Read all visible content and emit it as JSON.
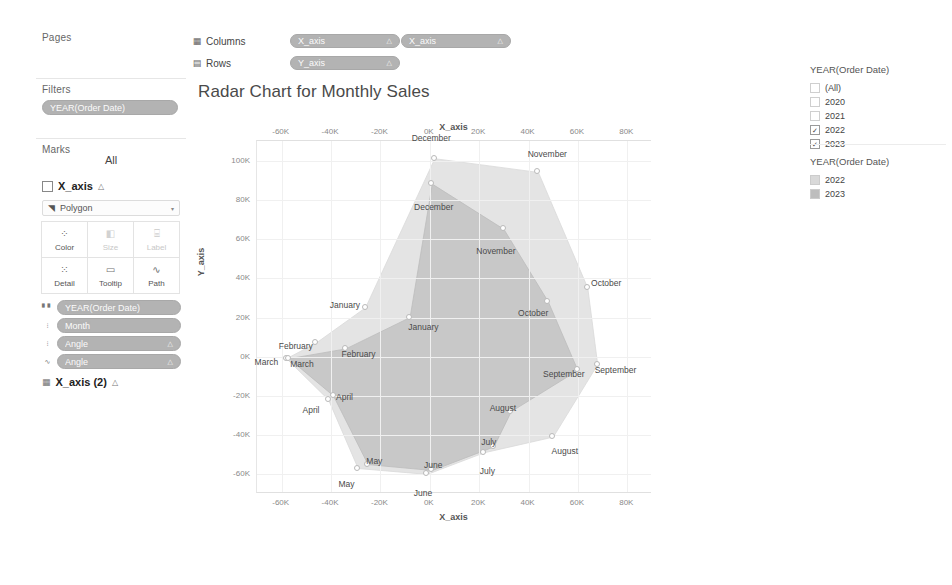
{
  "app": {
    "background": "#ffffff",
    "panel_border": "#e4e4e4"
  },
  "shelves": {
    "columns": {
      "icon": "columns-icon",
      "label": "Columns",
      "pills": [
        {
          "text": "X_axis",
          "caret": "△"
        },
        {
          "text": "X_axis",
          "caret": "△"
        }
      ]
    },
    "rows": {
      "icon": "rows-icon",
      "label": "Rows",
      "pills": [
        {
          "text": "Y_axis",
          "caret": "△"
        }
      ]
    }
  },
  "left_panel": {
    "pages": {
      "title": "Pages"
    },
    "filters": {
      "title": "Filters",
      "pills": [
        {
          "text": "YEAR(Order Date)",
          "caret": ""
        }
      ]
    },
    "marks": {
      "title": "Marks",
      "all_label": "All",
      "card_label": "X_axis",
      "card_tri": "△",
      "mark_type": "Polygon",
      "mark_type_caret": "▾",
      "buttons": [
        {
          "label": "Color",
          "icon": "color-icon",
          "glyph": "⁘",
          "dim": false
        },
        {
          "label": "Size",
          "icon": "size-icon",
          "glyph": "◧",
          "dim": true
        },
        {
          "label": "Label",
          "icon": "label-icon",
          "glyph": "⌸",
          "dim": true
        },
        {
          "label": "Detail",
          "icon": "detail-icon",
          "glyph": "⁙",
          "dim": false
        },
        {
          "label": "Tooltip",
          "icon": "tooltip-icon",
          "glyph": "▭",
          "dim": false
        },
        {
          "label": "Path",
          "icon": "path-icon",
          "glyph": "∿",
          "dim": false
        }
      ],
      "pills": [
        {
          "icon": "color-pill-icon",
          "text": "YEAR(Order Date)",
          "caret": ""
        },
        {
          "icon": "detail-pill-icon",
          "text": "Month",
          "caret": ""
        },
        {
          "icon": "detail-pill-icon2",
          "text": "Angle",
          "caret": "△"
        },
        {
          "icon": "path-pill-icon",
          "text": "Angle",
          "caret": "△"
        }
      ],
      "card2_label": "X_axis (2)",
      "card2_tri": "△",
      "card2_icon": "bar-icon"
    }
  },
  "viz": {
    "title": "Radar Chart for Monthly Sales",
    "axis_top_title": "X_axis",
    "axis_bottom_title": "X_axis",
    "axis_left_title": "Y_axis"
  },
  "right_panel": {
    "filter_card": {
      "title": "YEAR(Order Date)",
      "options": [
        {
          "label": "(All)",
          "checked": false,
          "faded": true
        },
        {
          "label": "2020",
          "checked": false,
          "faded": true
        },
        {
          "label": "2021",
          "checked": false,
          "faded": true
        },
        {
          "label": "2022",
          "checked": true,
          "faded": false
        },
        {
          "label": "2023",
          "checked": true,
          "faded": false
        }
      ],
      "check_glyph": "✓"
    },
    "color_legend": {
      "title": "YEAR(Order Date)",
      "items": [
        {
          "label": "2022",
          "color": "#d9d9d9"
        },
        {
          "label": "2023",
          "color": "#bdbdbd"
        }
      ]
    }
  },
  "chart_data": {
    "type": "radar",
    "title": "Radar Chart for Monthly Sales",
    "xlabel": "X_axis",
    "ylabel": "Y_axis",
    "xlim": [
      -70000,
      90000
    ],
    "ylim": [
      -70000,
      110000
    ],
    "xticks": [
      -60000,
      -40000,
      -20000,
      0,
      20000,
      40000,
      60000,
      80000
    ],
    "xtick_labels": [
      "-60K",
      "-40K",
      "-20K",
      "0K",
      "20K",
      "40K",
      "60K",
      "80K"
    ],
    "yticks": [
      100000,
      80000,
      60000,
      40000,
      20000,
      0,
      -20000,
      -40000,
      -60000
    ],
    "ytick_labels": [
      "100K",
      "80K",
      "60K",
      "40K",
      "20K",
      "0K",
      "-20K",
      "-40K",
      "-60K"
    ],
    "grid": true,
    "legend_position": "right",
    "categories": [
      "January",
      "February",
      "March",
      "April",
      "May",
      "June",
      "July",
      "August",
      "September",
      "October",
      "November",
      "December"
    ],
    "series": [
      {
        "name": "2022",
        "color": "#d9d9d9",
        "points": [
          {
            "label": "January",
            "x": -26000,
            "y": 25000
          },
          {
            "label": "February",
            "x": -46000,
            "y": 7000
          },
          {
            "label": "March",
            "x": -58000,
            "y": -1000
          },
          {
            "label": "April",
            "x": -41000,
            "y": -22000
          },
          {
            "label": "May",
            "x": -29000,
            "y": -57000
          },
          {
            "label": "June",
            "x": -1000,
            "y": -60000
          },
          {
            "label": "July",
            "x": 22000,
            "y": -49000
          },
          {
            "label": "August",
            "x": 50000,
            "y": -41000
          },
          {
            "label": "September",
            "x": 68000,
            "y": -4000
          },
          {
            "label": "October",
            "x": 64000,
            "y": 35000
          },
          {
            "label": "November",
            "x": 44000,
            "y": 94000
          },
          {
            "label": "December",
            "x": 2000,
            "y": 101000
          }
        ]
      },
      {
        "name": "2023",
        "color": "#bdbdbd",
        "points": [
          {
            "label": "January",
            "x": -8000,
            "y": 20000
          },
          {
            "label": "February",
            "x": -34000,
            "y": 4000
          },
          {
            "label": "March",
            "x": -57000,
            "y": -1000
          },
          {
            "label": "April",
            "x": -39000,
            "y": -20000
          },
          {
            "label": "May",
            "x": -25000,
            "y": -55000
          },
          {
            "label": "June",
            "x": 1000,
            "y": -58000
          },
          {
            "label": "July",
            "x": 26000,
            "y": -46000
          },
          {
            "label": "August",
            "x": 33000,
            "y": -28000
          },
          {
            "label": "September",
            "x": 60000,
            "y": -7000
          },
          {
            "label": "October",
            "x": 48000,
            "y": 28000
          },
          {
            "label": "November",
            "x": 30000,
            "y": 65000
          },
          {
            "label": "December",
            "x": 1000,
            "y": 88000
          }
        ]
      }
    ]
  }
}
